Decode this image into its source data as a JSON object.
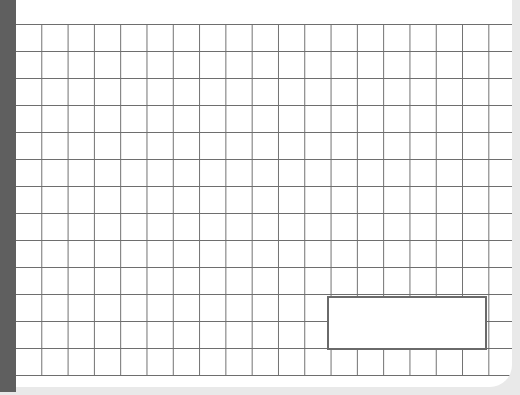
{
  "sheet": {
    "type": "graph-paper",
    "grid": {
      "columns": 19,
      "rows": 13,
      "cell_size_px": 26,
      "line_color": "#6e6e6e"
    },
    "spine_color": "#5f5f5f",
    "highlighted_rectangle": {
      "col_start": 12,
      "row_start": 10,
      "width_cells": 6,
      "height_cells": 2,
      "border_color": "#6a6a6a"
    }
  }
}
